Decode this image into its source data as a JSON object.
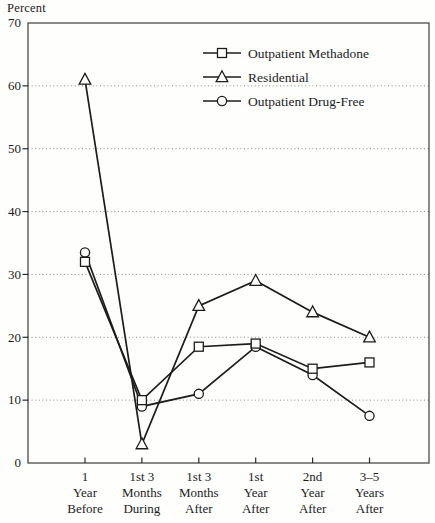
{
  "chart_data": {
    "type": "line",
    "title": "",
    "ylabel": "Percent",
    "xlabel": "",
    "ylim": [
      0,
      70
    ],
    "yticks": [
      0,
      10,
      20,
      30,
      40,
      50,
      60,
      70
    ],
    "grid": "horizontal-dotted",
    "legend_position": "top-right-inside",
    "categories": [
      [
        "1",
        "Year",
        "Before"
      ],
      [
        "1st 3",
        "Months",
        "During"
      ],
      [
        "1st 3",
        "Months",
        "After"
      ],
      [
        "1st",
        "Year",
        "After"
      ],
      [
        "2nd",
        "Year",
        "After"
      ],
      [
        "3–5",
        "Years",
        "After"
      ]
    ],
    "series": [
      {
        "name": "Outpatient Methadone",
        "marker": "square",
        "values": [
          32,
          10,
          18.5,
          19,
          15,
          16
        ]
      },
      {
        "name": "Residential",
        "marker": "triangle",
        "values": [
          61,
          3,
          25,
          29,
          24,
          20
        ]
      },
      {
        "name": "Outpatient Drug-Free",
        "marker": "circle",
        "values": [
          33.5,
          9,
          11,
          18.5,
          14,
          7.5
        ]
      }
    ],
    "colors": {
      "line": "#1c1c1c",
      "marker_fill": "#fefefd",
      "grid": "#8a8a8a",
      "frame": "#4a4a4a",
      "text": "#1c1c1c",
      "background": "#fefefd"
    }
  }
}
